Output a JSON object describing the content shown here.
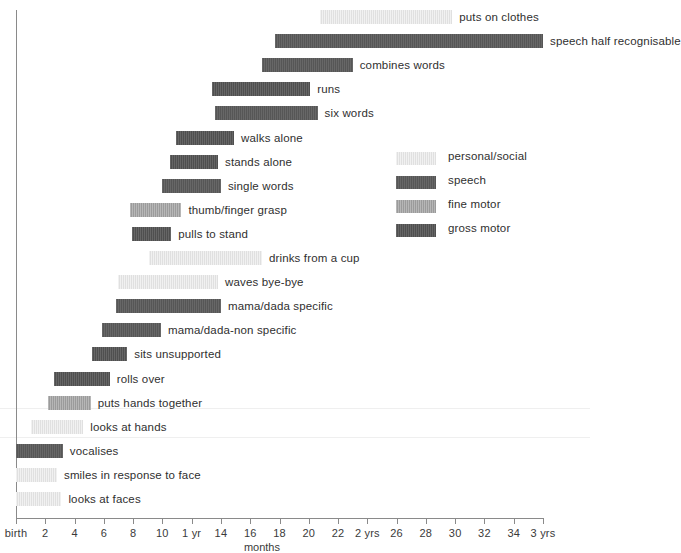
{
  "chart_data": {
    "type": "bar",
    "chart_subtype": "horizontal-range-bar (Gantt-style developmental milestones)",
    "title": "",
    "xlabel": "months",
    "ylabel": "",
    "xlim": [
      0,
      36
    ],
    "grid": false,
    "legend_position": "middle-right",
    "x_unit": "months",
    "x_tick_values": [
      0,
      2,
      4,
      6,
      8,
      10,
      12,
      14,
      16,
      18,
      20,
      22,
      24,
      26,
      28,
      30,
      32,
      34,
      36
    ],
    "x_tick_labels": [
      "birth",
      "2",
      "4",
      "6",
      "8",
      "10",
      "1 yr",
      "14",
      "16",
      "18",
      "20",
      "22",
      "2 yrs",
      "26",
      "28",
      "30",
      "32",
      "34",
      "3 yrs"
    ],
    "categories": [
      "personal/social",
      "speech",
      "fine motor",
      "gross motor"
    ],
    "category_colors": {
      "personal/social": "#e0e0e0",
      "speech": "#565656",
      "fine motor": "#9b9b9b",
      "gross motor": "#4f4f4f"
    },
    "bars": [
      {
        "label": "puts on clothes",
        "category": "personal/social",
        "start": 20.8,
        "end": 29.8,
        "label_side": "right"
      },
      {
        "label": "speech half recognisable",
        "category": "speech",
        "start": 17.7,
        "end": 36.0,
        "label_side": "right"
      },
      {
        "label": "combines words",
        "category": "speech",
        "start": 16.8,
        "end": 23.0,
        "label_side": "right"
      },
      {
        "label": "runs",
        "category": "gross motor",
        "start": 13.4,
        "end": 20.1,
        "label_side": "right"
      },
      {
        "label": "six words",
        "category": "speech",
        "start": 13.6,
        "end": 20.6,
        "label_side": "right"
      },
      {
        "label": "walks alone",
        "category": "gross motor",
        "start": 10.9,
        "end": 14.9,
        "label_side": "right"
      },
      {
        "label": "stands alone",
        "category": "gross motor",
        "start": 10.5,
        "end": 13.8,
        "label_side": "right"
      },
      {
        "label": "single words",
        "category": "speech",
        "start": 10.0,
        "end": 14.0,
        "label_side": "right"
      },
      {
        "label": "thumb/finger grasp",
        "category": "fine motor",
        "start": 7.8,
        "end": 11.3,
        "label_side": "right"
      },
      {
        "label": "pulls to stand",
        "category": "gross motor",
        "start": 7.9,
        "end": 10.6,
        "label_side": "right"
      },
      {
        "label": "drinks from a cup",
        "category": "personal/social",
        "start": 9.1,
        "end": 16.8,
        "label_side": "right"
      },
      {
        "label": "waves bye-bye",
        "category": "personal/social",
        "start": 7.0,
        "end": 13.8,
        "label_side": "right"
      },
      {
        "label": "mama/dada specific",
        "category": "speech",
        "start": 6.8,
        "end": 14.0,
        "label_side": "right"
      },
      {
        "label": "mama/dada-non specific",
        "category": "speech",
        "start": 5.9,
        "end": 9.9,
        "label_side": "right"
      },
      {
        "label": "sits unsupported",
        "category": "gross motor",
        "start": 5.2,
        "end": 7.6,
        "label_side": "right"
      },
      {
        "label": "rolls over",
        "category": "gross motor",
        "start": 2.6,
        "end": 6.4,
        "label_side": "right"
      },
      {
        "label": "puts hands together",
        "category": "fine motor",
        "start": 2.2,
        "end": 5.1,
        "label_side": "right"
      },
      {
        "label": "looks at hands",
        "category": "personal/social",
        "start": 1.0,
        "end": 4.6,
        "label_side": "right"
      },
      {
        "label": "vocalises",
        "category": "speech",
        "start": 0.0,
        "end": 3.2,
        "label_side": "right"
      },
      {
        "label": "smiles in response to face",
        "category": "personal/social",
        "start": 0.0,
        "end": 2.8,
        "label_side": "right"
      },
      {
        "label": "looks at faces",
        "category": "personal/social",
        "start": 0.0,
        "end": 3.1,
        "label_side": "right"
      }
    ]
  },
  "legend": {
    "items": [
      {
        "label": "personal/social",
        "category": "personal/social"
      },
      {
        "label": "speech",
        "category": "speech"
      },
      {
        "label": "fine motor",
        "category": "fine motor"
      },
      {
        "label": "gross motor",
        "category": "gross motor"
      }
    ]
  },
  "layout": {
    "axis_left_px": 16,
    "axis_right_px": 543,
    "axis_y_px": 518,
    "first_row_y_px": 10,
    "row_step_px": 24.1,
    "bar_height_px": 14,
    "label_gap_px": 7
  }
}
